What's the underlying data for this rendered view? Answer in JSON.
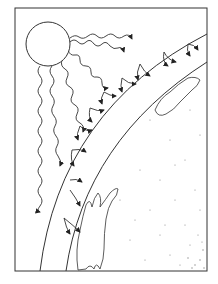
{
  "diagram": {
    "elements": {
      "sun": "sun-circle",
      "rays": "wavy radiation rays",
      "atmosphere": "atmosphere layer between two arcs",
      "earth": "stippled earth surface",
      "clouds": "cloud shapes"
    },
    "colors": {
      "line": "#222222",
      "background": "#ffffff",
      "stipple": "#888888"
    }
  }
}
